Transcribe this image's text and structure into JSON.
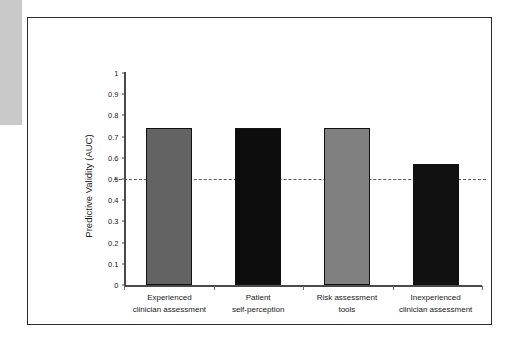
{
  "figure": {
    "left_margin_strip": "",
    "border_color": "#2b2b2b"
  },
  "chart_data": {
    "type": "bar",
    "title": "",
    "xlabel": "",
    "ylabel": "Predictive Validity (AUC)",
    "ylim": [
      0,
      1
    ],
    "ytick_labels": [
      "1",
      "0.9",
      "0.8",
      "0.7",
      "0.6",
      "0.5",
      "0.4",
      "0.3",
      "0.2",
      "0.1",
      "0"
    ],
    "ytick_values": [
      1,
      0.9,
      0.8,
      0.7,
      0.6,
      0.5,
      0.4,
      0.3,
      0.2,
      0.1,
      0
    ],
    "grid": false,
    "legend": null,
    "categories": [
      "Experienced clinician assessment",
      "Patient self-perception",
      "Risk assessment tools",
      "Inexperienced clinician assessment"
    ],
    "category_lines": [
      [
        "Experienced",
        "clinician assessment"
      ],
      [
        "Patient",
        "self-perception"
      ],
      [
        "Risk assessment",
        "tools"
      ],
      [
        "Inexperienced",
        "clinician assessment"
      ]
    ],
    "values": [
      0.74,
      0.74,
      0.74,
      0.57
    ],
    "bar_colors": [
      "#636363",
      "#0d0d0d",
      "#808080",
      "#111111"
    ],
    "bar_edge_color": "#111111",
    "reference_line": {
      "value": 0.5,
      "style": "dashed",
      "color": "#5a5a5a"
    }
  }
}
